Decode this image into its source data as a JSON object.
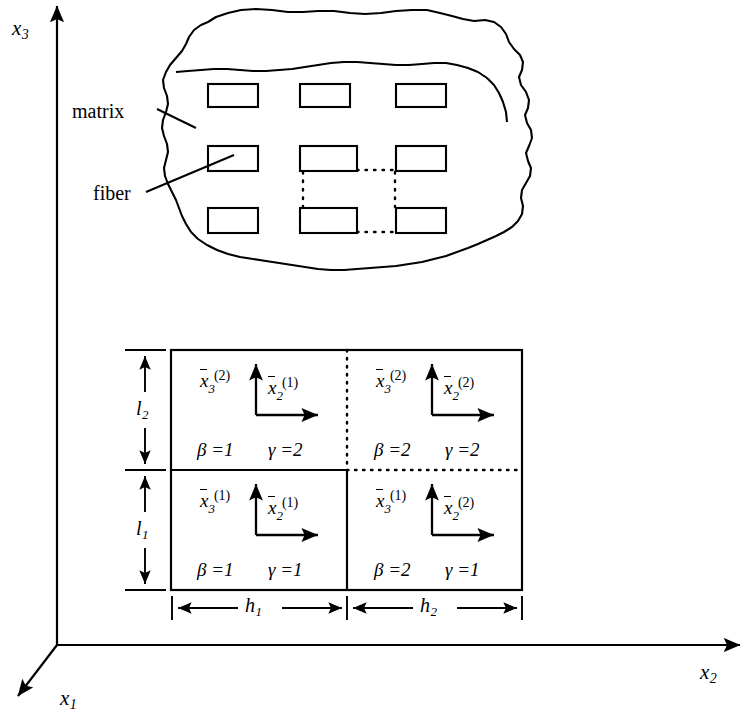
{
  "figure": {
    "global_axes": [
      {
        "name": "x3",
        "base": "x",
        "sub": "3"
      },
      {
        "name": "x2",
        "base": "x",
        "sub": "2"
      },
      {
        "name": "x1",
        "base": "x",
        "sub": "1"
      }
    ],
    "callouts": [
      {
        "id": "matrix",
        "label": "matrix"
      },
      {
        "id": "fiber",
        "label": "fiber"
      }
    ],
    "dimensions": [
      {
        "id": "l2",
        "base": "l",
        "sub": "2"
      },
      {
        "id": "l1",
        "base": "l",
        "sub": "1"
      },
      {
        "id": "h1",
        "base": "h",
        "sub": "1"
      },
      {
        "id": "h2",
        "base": "h",
        "sub": "2"
      }
    ],
    "cells": [
      {
        "id": "cell-top-left",
        "beta": "β =1",
        "gamma": "γ =2",
        "axis_vertical": {
          "base": "x",
          "sub": "3",
          "sup": "(2)"
        },
        "axis_horizontal": {
          "base": "x",
          "sub": "2",
          "sup": "(1)"
        }
      },
      {
        "id": "cell-top-right",
        "beta": "β =2",
        "gamma": "γ =2",
        "axis_vertical": {
          "base": "x",
          "sub": "3",
          "sup": "(2)"
        },
        "axis_horizontal": {
          "base": "x",
          "sub": "2",
          "sup": "(2)"
        }
      },
      {
        "id": "cell-bottom-left",
        "beta": "β =1",
        "gamma": "γ =1",
        "axis_vertical": {
          "base": "x",
          "sub": "3",
          "sup": "(1)"
        },
        "axis_horizontal": {
          "base": "x",
          "sub": "2",
          "sup": "(1)"
        }
      },
      {
        "id": "cell-bottom-right",
        "beta": "β =2",
        "gamma": "γ =1",
        "axis_vertical": {
          "base": "x",
          "sub": "3",
          "sup": "(1)"
        },
        "axis_horizontal": {
          "base": "x",
          "sub": "2",
          "sup": "(2)"
        }
      }
    ],
    "colors": {
      "stroke": "#000000",
      "background": "#ffffff"
    },
    "fiber_grid": {
      "rows": 3,
      "cols": 3,
      "rect_width": 50,
      "rect_height": 23
    }
  }
}
